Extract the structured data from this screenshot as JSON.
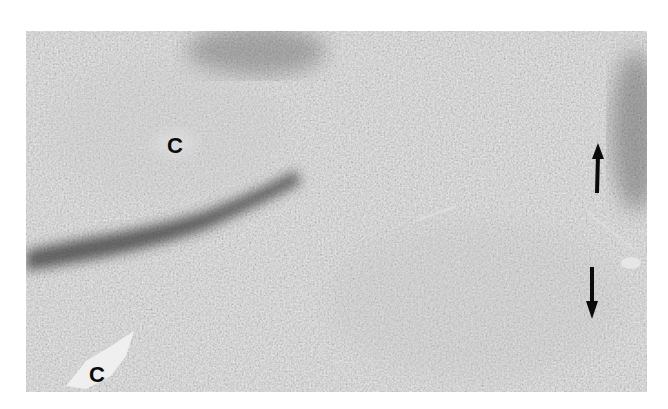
{
  "figure": {
    "type": "grayscale micrograph",
    "labels": [
      {
        "text": "C",
        "x": 175,
        "y": 146
      },
      {
        "text": "C",
        "x": 97,
        "y": 375
      }
    ],
    "arrows": [
      {
        "direction": "up",
        "x": 597,
        "y1": 190,
        "y2": 148
      },
      {
        "direction": "down",
        "x": 592,
        "y1": 270,
        "y2": 316
      }
    ],
    "colors": {
      "background": "#ffffff",
      "tissue": "#9a9a9a",
      "dark_band": "#3a3a3a",
      "vessel_lumen": "#eeeeee",
      "annotation": "#0a0a0a"
    }
  }
}
